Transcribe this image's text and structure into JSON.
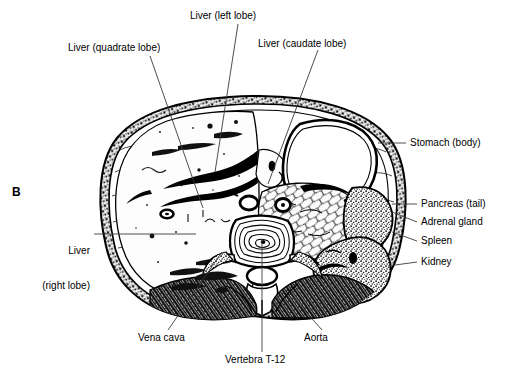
{
  "figure": {
    "panel_letter": "B",
    "type": "anatomical-cross-section"
  },
  "labels": {
    "liver_quadrate": "Liver (quadrate lobe)",
    "liver_left": "Liver (left lobe)",
    "liver_caudate": "Liver (caudate lobe)",
    "stomach": "Stomach (body)",
    "pancreas": "Pancreas (tail)",
    "adrenal": "Adrenal gland",
    "spleen": "Spleen",
    "kidney": "Kidney",
    "liver_right_line1": "Liver",
    "liver_right_line2": "(right lobe)",
    "vena_cava": "Vena cava",
    "vertebra": "Vertebra T-12",
    "aorta": "Aorta"
  },
  "colors": {
    "ink": "#000000",
    "background": "#ffffff",
    "leader": "#3a3a3a",
    "wall_dark": "#1a1a1a",
    "tissue_mid": "#555555",
    "organ_light": "#fafafa"
  }
}
